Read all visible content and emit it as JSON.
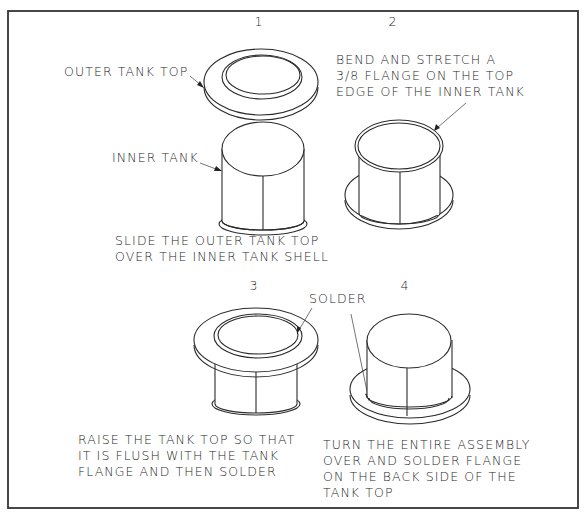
{
  "diagram": {
    "frame_color": "#333333",
    "line_color": "#2b2b2b",
    "background": "#ffffff",
    "steps": [
      {
        "number": "1",
        "callouts": [
          {
            "label": "OUTER TANK TOP"
          },
          {
            "label": "INNER TANK"
          }
        ],
        "caption_lines": [
          "SLIDE THE OUTER TANK TOP",
          "OVER THE INNER TANK SHELL"
        ]
      },
      {
        "number": "2",
        "callouts": [
          {
            "lines": [
              "BEND AND STRETCH A",
              "3/8 FLANGE ON THE TOP",
              "EDGE OF THE INNER TANK"
            ]
          }
        ]
      },
      {
        "number": "3",
        "caption_lines": [
          "RAISE THE TANK TOP SO THAT",
          "IT IS FLUSH WITH THE TANK",
          "FLANGE AND THEN SOLDER"
        ]
      },
      {
        "number": "4",
        "caption_lines": [
          "TURN THE ENTIRE ASSEMBLY",
          "OVER AND SOLDER FLANGE",
          "ON THE BACK SIDE OF THE",
          "TANK TOP"
        ]
      }
    ],
    "shared_callouts": {
      "solder": "SOLDER"
    }
  }
}
